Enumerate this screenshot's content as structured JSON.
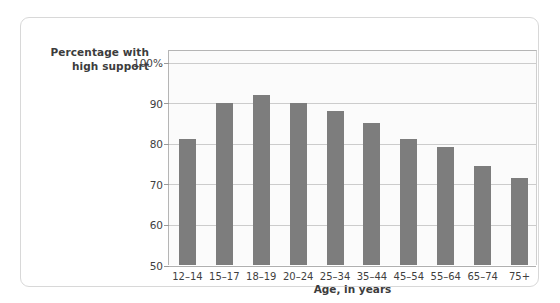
{
  "figure": {
    "frame_border_color": "#d8d8d8",
    "background_color": "#ffffff",
    "plot_background_color": "#fbfbfb",
    "bar_color": "#7d7d7d",
    "gridline_color": "#cccccc"
  },
  "axis_titles": {
    "y_line1": "Percentage with",
    "y_line2": "high support",
    "x": "Age, in years"
  },
  "chart_data": {
    "type": "bar",
    "title": "",
    "subtitle": "",
    "xlabel": "Age, in years",
    "ylabel": "Percentage with high support",
    "categories": [
      "12–14",
      "15–17",
      "18–19",
      "20–24",
      "25–34",
      "35–44",
      "45–54",
      "55–64",
      "65–74",
      "75+"
    ],
    "values": [
      81,
      90,
      92,
      90,
      88,
      85,
      81,
      79,
      74.5,
      71.5
    ],
    "ylim": [
      50,
      103
    ],
    "yticks": [
      50,
      60,
      70,
      80,
      90,
      100
    ],
    "ytick_labels": [
      "50",
      "60",
      "70",
      "80",
      "90",
      "100%"
    ],
    "grid": true,
    "legend": "none",
    "bar_color": "#7d7d7d",
    "annotations": []
  }
}
